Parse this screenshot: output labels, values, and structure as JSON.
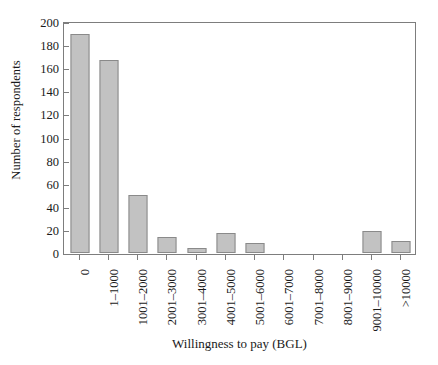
{
  "chart_data": {
    "type": "bar",
    "title": "",
    "xlabel": "Willingness to pay (BGL)",
    "ylabel": "Number of respondents",
    "categories": [
      "0",
      "1–1000",
      "1001–2000",
      "2001–3000",
      "3001–4000",
      "4001–5000",
      "5001–6000",
      "6001–7000",
      "7001–8000",
      "8001–9000",
      "9001–10000",
      ">10000"
    ],
    "values": [
      190,
      167,
      50,
      14,
      4,
      17,
      9,
      0,
      0,
      0,
      19,
      10
    ],
    "ylim": [
      0,
      200
    ],
    "ytick_labels": [
      "0",
      "20",
      "40",
      "60",
      "80",
      "100",
      "120",
      "140",
      "160",
      "180",
      "200"
    ],
    "ytick_values": [
      0,
      20,
      40,
      60,
      80,
      100,
      120,
      140,
      160,
      180,
      200
    ],
    "grid": false,
    "legend": "none",
    "bar_fill_color": "#c2c2c2",
    "bar_edge_color": "#8a8a8a",
    "axis_color": "#7d7d7d"
  }
}
